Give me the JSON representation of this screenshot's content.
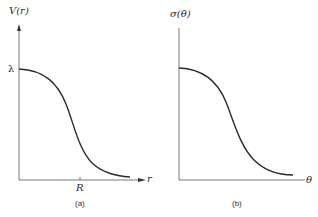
{
  "panel_a": {
    "y_label": "V(r)",
    "x_label": "r",
    "y_tick": "λ",
    "x_tick": "R",
    "caption": "(a)"
  },
  "panel_b": {
    "y_label": "σ(θ)",
    "x_label": "θ",
    "caption": "(b)"
  },
  "colors": {
    "line": "#2a2a2a",
    "axis": "#555555",
    "background": "#ffffff"
  }
}
